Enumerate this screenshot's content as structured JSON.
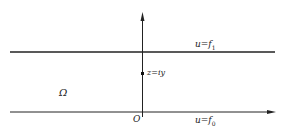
{
  "diagram": {
    "region_label": "Ω",
    "origin_label": "O",
    "top_line": {
      "u": "u",
      "eq": "=",
      "f": "f",
      "sub": "1"
    },
    "bottom_line": {
      "u": "u",
      "eq": "=",
      "f": "f",
      "sub": "0"
    },
    "point_label": "z=iy",
    "colors": {
      "line": "#222222",
      "background": "#ffffff"
    }
  }
}
